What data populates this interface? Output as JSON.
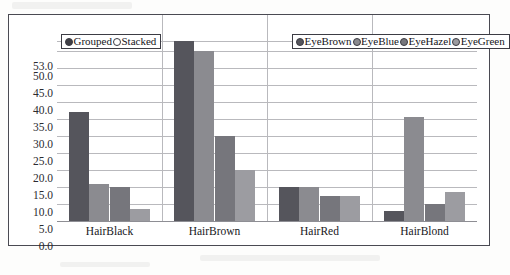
{
  "mode_legend": {
    "items": [
      {
        "label": "Grouped",
        "selected": true,
        "marker_color": "#3f3f46"
      },
      {
        "label": "Stacked",
        "selected": false,
        "marker_color": "#ffffff"
      }
    ]
  },
  "chart_data": {
    "type": "bar",
    "title": "",
    "subtitle": "",
    "xlabel": "",
    "ylabel": "",
    "grouping": "grouped",
    "grid": true,
    "legend_position": "top-right",
    "categories": [
      "HairBlack",
      "HairBrown",
      "HairRed",
      "HairBlond"
    ],
    "ylim": [
      0,
      53
    ],
    "yticks": [
      "0.0",
      "5.0",
      "10.0",
      "15.0",
      "20.0",
      "25.0",
      "30.0",
      "35.0",
      "40.0",
      "45.0",
      "50.0",
      "53.0"
    ],
    "ytick_values": [
      0,
      5,
      10,
      15,
      20,
      25,
      30,
      35,
      40,
      45,
      50,
      53
    ],
    "series": [
      {
        "name": "EyeBrown",
        "color": "#55555c",
        "values": [
          32.0,
          53.0,
          10.0,
          3.0
        ]
      },
      {
        "name": "EyeBlue",
        "color": "#8b8b90",
        "values": [
          11.0,
          50.0,
          10.0,
          30.5
        ]
      },
      {
        "name": "EyeHazel",
        "color": "#76767c",
        "values": [
          10.0,
          25.0,
          7.5,
          5.0
        ]
      },
      {
        "name": "EyeGreen",
        "color": "#9c9ca1",
        "values": [
          3.5,
          15.0,
          7.5,
          8.5
        ]
      }
    ]
  }
}
